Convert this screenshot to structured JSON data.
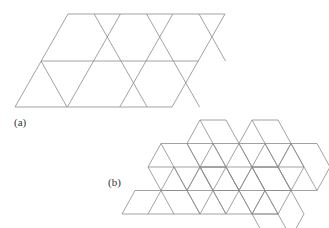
{
  "figure": {
    "panels": [
      {
        "label": "(a)",
        "description": "Trihexagonal (kagome) tiling of hexagons and triangles inside a parallelogram"
      },
      {
        "label": "(b)",
        "description": "Rhombille tiling (stacked cubes) of rhombi"
      }
    ],
    "stroke_color": "#8a8a8a"
  }
}
